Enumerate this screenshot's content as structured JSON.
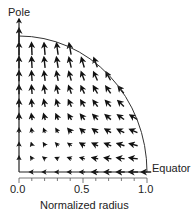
{
  "chart_data": {
    "type": "quiver",
    "title": "",
    "xlabel": "Normalized radius",
    "ylabel": "",
    "x_ticks": [
      "0.0",
      "0.5",
      "1.0"
    ],
    "x_minor_tick_step": 0.1,
    "xlim": [
      0.0,
      1.0
    ],
    "ylim": [
      0.0,
      1.0
    ],
    "grid": false,
    "boundary": "quarter-circle of radius 1.0",
    "annotations": [
      {
        "text": "Pole",
        "position": "top of vertical axis (x=0, y=1)"
      },
      {
        "text": "Equator",
        "position": "right end of horizontal axis (x=1, y=0)"
      }
    ],
    "grid_spacing": 0.1,
    "field_description": "Arrows point upward (toward the pole) along the axis, rotate to point up-left in the interior, and point left (inward) along the equator; magnitude largest near the pole and smallest near the origin.",
    "vectors_sample": [
      {
        "x": 0.0,
        "y": 1.0,
        "u": 0.0,
        "v": 0.9
      },
      {
        "x": 0.0,
        "y": 0.5,
        "u": 0.0,
        "v": 0.45
      },
      {
        "x": 0.0,
        "y": 0.1,
        "u": 0.0,
        "v": 0.09
      },
      {
        "x": 0.5,
        "y": 0.5,
        "u": -0.22,
        "v": 0.38
      },
      {
        "x": 0.5,
        "y": 0.8,
        "u": -0.18,
        "v": 0.61
      },
      {
        "x": 0.9,
        "y": 0.3,
        "u": -0.46,
        "v": 0.2
      },
      {
        "x": 0.5,
        "y": 0.0,
        "u": -0.3,
        "v": 0.0
      },
      {
        "x": 1.0,
        "y": 0.0,
        "u": -0.6,
        "v": 0.0
      }
    ]
  },
  "labels": {
    "pole": "Pole",
    "equator": "Equator",
    "xlabel": "Normalized radius",
    "tick_0": "0.0",
    "tick_05": "0.5",
    "tick_1": "1.0"
  }
}
